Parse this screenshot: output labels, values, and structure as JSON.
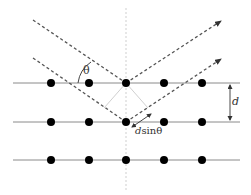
{
  "diagram": {
    "type": "bragg-diffraction",
    "labels": {
      "theta": "θ",
      "d": "d",
      "dsintheta_d": "d",
      "dsintheta_rest": "sinθ"
    },
    "lattice": {
      "rows": 3,
      "atoms_per_row": 5,
      "row_y": [
        83,
        122,
        160
      ],
      "atom_x": [
        51,
        89,
        126,
        164,
        202
      ]
    },
    "colors": {
      "plane": "#8a8a8a",
      "atom": "#000000",
      "ray": "#555555",
      "normal": "#c8c8c8",
      "construction": "#d0d0d0"
    }
  }
}
